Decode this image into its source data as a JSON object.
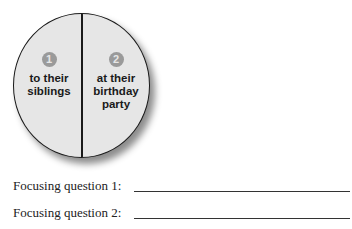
{
  "diagram": {
    "sections": [
      {
        "number": "1",
        "label_lines": [
          "to their",
          "siblings"
        ]
      },
      {
        "number": "2",
        "label_lines": [
          "at their",
          "birthday",
          "party"
        ]
      }
    ]
  },
  "questions": [
    {
      "label": "Focusing question 1:"
    },
    {
      "label": "Focusing question 2:"
    }
  ]
}
